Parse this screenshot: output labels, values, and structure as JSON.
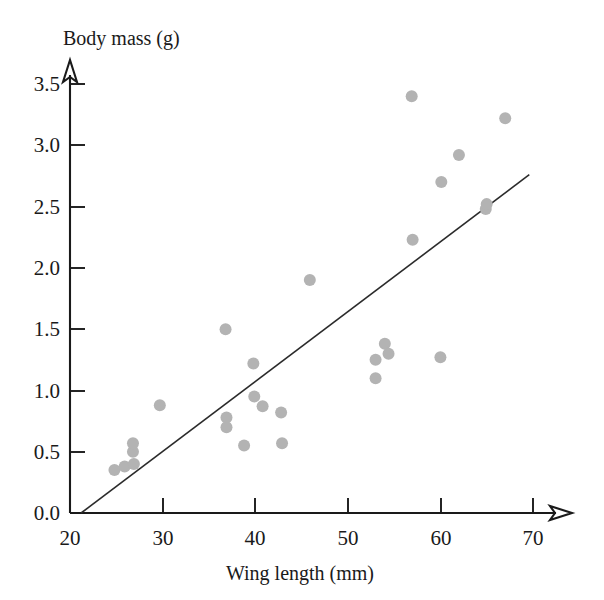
{
  "chart_data": {
    "type": "scatter",
    "title": "",
    "xlabel": "Wing length (mm)",
    "ylabel": "Body mass (g)",
    "xlim": [
      20,
      71.5
    ],
    "ylim": [
      0.0,
      3.75
    ],
    "xticks": [
      20,
      30,
      40,
      50,
      60,
      70
    ],
    "xtick_labels": [
      "20",
      "30",
      "40",
      "50",
      "60",
      "70"
    ],
    "yticks": [
      0.0,
      0.5,
      1.0,
      1.5,
      2.0,
      2.5,
      3.0,
      3.5
    ],
    "ytick_labels": [
      "0.0",
      "0.5",
      "1.0",
      "1.5",
      "2.0",
      "2.5",
      "3.0",
      "3.5"
    ],
    "grid": false,
    "legend": false,
    "point_color": "#b3b3b3",
    "point_radius": 6,
    "line_color": "#2b2b2b",
    "axis_color": "#1a1a1a",
    "axis_arrows": true,
    "points": [
      {
        "x": 24.8,
        "y": 0.35
      },
      {
        "x": 25.9,
        "y": 0.38
      },
      {
        "x": 26.9,
        "y": 0.4
      },
      {
        "x": 26.8,
        "y": 0.5
      },
      {
        "x": 26.8,
        "y": 0.57
      },
      {
        "x": 29.7,
        "y": 0.88
      },
      {
        "x": 36.8,
        "y": 1.5
      },
      {
        "x": 36.9,
        "y": 0.78
      },
      {
        "x": 36.9,
        "y": 0.7
      },
      {
        "x": 38.8,
        "y": 0.55
      },
      {
        "x": 39.8,
        "y": 1.22
      },
      {
        "x": 39.9,
        "y": 0.95
      },
      {
        "x": 40.8,
        "y": 0.87
      },
      {
        "x": 42.8,
        "y": 0.82
      },
      {
        "x": 42.9,
        "y": 0.57
      },
      {
        "x": 45.9,
        "y": 1.9
      },
      {
        "x": 53.0,
        "y": 1.25
      },
      {
        "x": 53.0,
        "y": 1.1
      },
      {
        "x": 54.0,
        "y": 1.38
      },
      {
        "x": 54.4,
        "y": 1.3
      },
      {
        "x": 56.9,
        "y": 3.4
      },
      {
        "x": 57.0,
        "y": 2.23
      },
      {
        "x": 60.0,
        "y": 1.27
      },
      {
        "x": 60.1,
        "y": 2.7
      },
      {
        "x": 62.0,
        "y": 2.92
      },
      {
        "x": 64.9,
        "y": 2.48
      },
      {
        "x": 65.0,
        "y": 2.52
      },
      {
        "x": 67.0,
        "y": 3.22
      }
    ],
    "fit_line": {
      "label": "regression line",
      "x_start": 21.2,
      "y_start": 0.0,
      "x_end": 69.6,
      "y_end": 2.76
    }
  }
}
